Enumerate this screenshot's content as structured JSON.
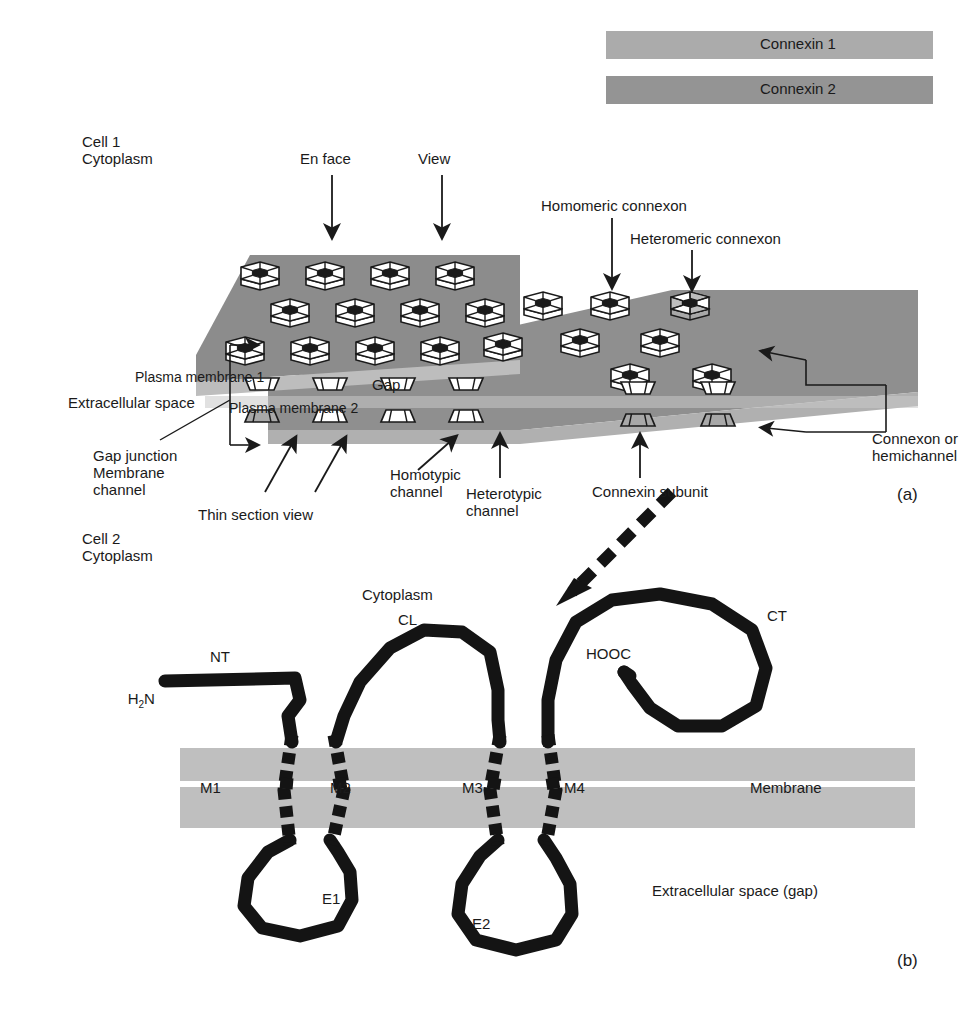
{
  "figure": {
    "title_domain": "cell-biology-diagram",
    "panels": [
      {
        "id": "a",
        "label": "(a)"
      },
      {
        "id": "b",
        "label": "(b)"
      }
    ]
  },
  "legend": {
    "items": [
      {
        "label": "Connexin 1",
        "color": "#ababab"
      },
      {
        "label": "Connexin 2",
        "color": "#949494"
      }
    ]
  },
  "panel_a": {
    "cell1": "Cell 1\nCytoplasm",
    "cell2": "Cell 2\nCytoplasm",
    "en_face": "En face",
    "view": "View",
    "homomeric": "Homomeric connexon",
    "heteromeric": "Heteromeric connexon",
    "plasma_membrane_1": "Plasma membrane 1",
    "plasma_membrane_2": "Plasma membrane 2",
    "extracellular_space": "Extracellular space",
    "gap": "Gap",
    "gap_junction": "Gap junction\nMembrane\nchannel",
    "thin_section_view": "Thin section view",
    "homotypic": "Homotypic\nchannel",
    "heterotypic": "Heterotypic\nchannel",
    "connexin_subunit": "Connexin subunit",
    "connexon_hemichannel": "Connexon or\nhemichannel",
    "panel_label": "(a)",
    "colors": {
      "membrane_top": "#8c8c8c",
      "membrane_bottom": "#a0a0a0",
      "membrane_edge": "#b6b6b6",
      "extracellular_band": "#c4c4c4",
      "connexon_face": "#ffffff",
      "connexon_shaded": "#a8a8a8",
      "outline": "#1a1a1a"
    }
  },
  "panel_b": {
    "nt": "NT",
    "h2n": "H",
    "h2n_sub": "2",
    "h2n_tail": "N",
    "cytoplasm": "Cytoplasm",
    "cl": "CL",
    "ct": "CT",
    "hooc": "HOOC",
    "membrane": "Membrane",
    "tm_segments": [
      "M1",
      "M2",
      "M3",
      "M4"
    ],
    "extracellular_loops": [
      "E1",
      "E2"
    ],
    "extracellular_space_gap": "Extracellular space (gap)",
    "panel_label": "(b)",
    "colors": {
      "membrane_band": "#bfbfbf",
      "chain": "#141414"
    }
  }
}
